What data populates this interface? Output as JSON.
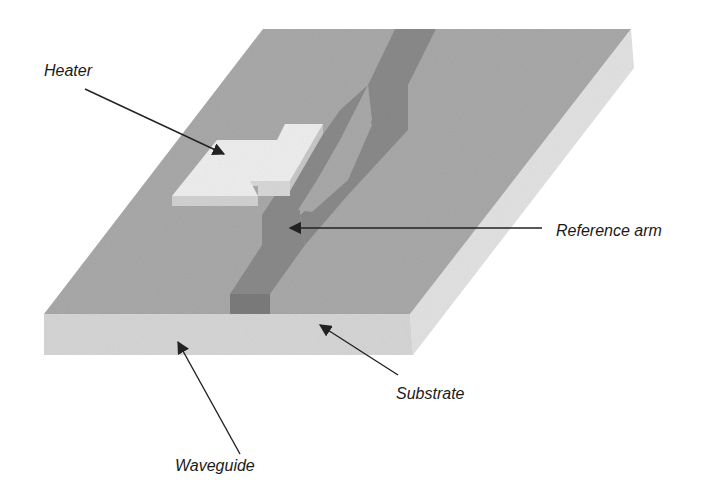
{
  "figure": {
    "labels": {
      "heater": "Heater",
      "reference_arm": "Reference arm",
      "substrate": "Substrate",
      "waveguide": "Waveguide"
    },
    "colors": {
      "substrate_top": "#a9a9a9",
      "substrate_front": "#d6d6d6",
      "substrate_side": "#e2e2e2",
      "waveguide": "#8a8a8a",
      "waveguide_side": "#7c7c7c",
      "heater_top": "#eeeeee",
      "heater_side": "#d2d2d2",
      "arrow": "#222222",
      "label_text": "#1a1a1a"
    }
  }
}
